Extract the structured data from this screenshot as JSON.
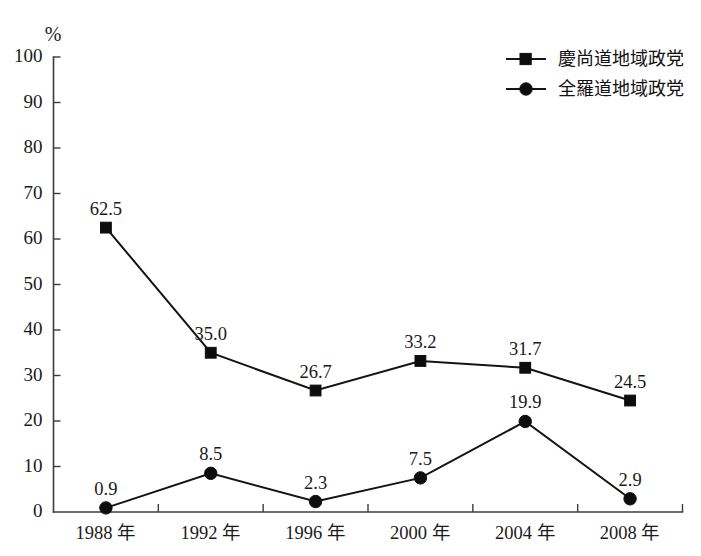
{
  "chart_data": {
    "type": "line",
    "title": "",
    "xlabel": "",
    "ylabel": "%",
    "ylim": [
      0,
      100
    ],
    "ytick_step": 10,
    "grid": false,
    "legend_position": "top-right",
    "categories": [
      "1988 年",
      "1992 年",
      "1996 年",
      "2000 年",
      "2004 年",
      "2008 年"
    ],
    "ytick_labels": [
      "100",
      "90",
      "80",
      "70",
      "60",
      "50",
      "40",
      "30",
      "20",
      "10",
      "0"
    ],
    "ytick_values": [
      100,
      90,
      80,
      70,
      60,
      50,
      40,
      30,
      20,
      10,
      0
    ],
    "series": [
      {
        "name": "慶尚道地域政党",
        "marker": "square",
        "color": "#0d0d0d",
        "values": [
          62.5,
          35.0,
          26.7,
          33.2,
          31.7,
          24.5
        ],
        "labels": [
          "62.5",
          "35.0",
          "26.7",
          "33.2",
          "31.7",
          "24.5"
        ]
      },
      {
        "name": "全羅道地域政党",
        "marker": "circle",
        "color": "#0d0d0d",
        "values": [
          0.9,
          8.5,
          2.3,
          7.5,
          19.9,
          2.9
        ],
        "labels": [
          "0.9",
          "8.5",
          "2.3",
          "7.5",
          "19.9",
          "2.9"
        ]
      }
    ]
  },
  "axis": {
    "unit_label": "%"
  },
  "legend": {
    "entries": [
      {
        "label": "慶尚道地域政党",
        "marker": "square"
      },
      {
        "label": "全羅道地域政党",
        "marker": "circle"
      }
    ]
  }
}
